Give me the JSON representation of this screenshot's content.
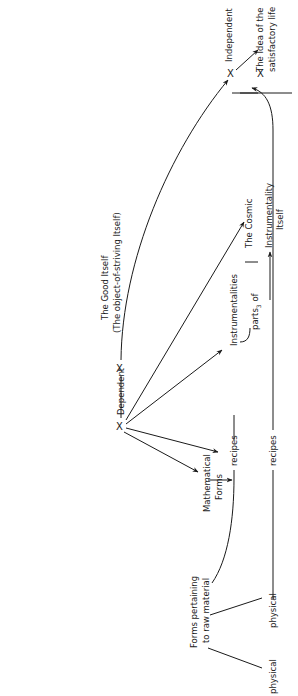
{
  "nodes": {
    "good_itself": {
      "title": "The Good Itself",
      "subtitle": "(The object-of-striving Itself)"
    },
    "independent": {
      "label": "Independent"
    },
    "idea": {
      "line1": "The Idea of the",
      "line2": "satisfactory life"
    },
    "dependent": {
      "label": "Dependent"
    },
    "cosmic": {
      "label": "The Cosmic"
    },
    "instrumentality": {
      "line1": "Instrumentality",
      "line2": "Itself"
    },
    "instrumentalities": {
      "label": "Instrumentalities"
    },
    "parts": {
      "prefix": "parts",
      "subscript": "3",
      "suffix": " of"
    },
    "recipes_inner": {
      "label": "recipes"
    },
    "recipes_outer": {
      "label": "recipes"
    },
    "mathematical": {
      "line1": "Mathematical",
      "line2": "Forms"
    },
    "raw_forms": {
      "line1": "Forms pertaining",
      "line2": "to raw material"
    },
    "physical_a": {
      "label": "physical"
    },
    "physical_b": {
      "label": "physical"
    }
  },
  "markers": {
    "x_glyph": "X"
  },
  "colors": {
    "ink": "#1a1a1a",
    "background": "#ffffff"
  }
}
